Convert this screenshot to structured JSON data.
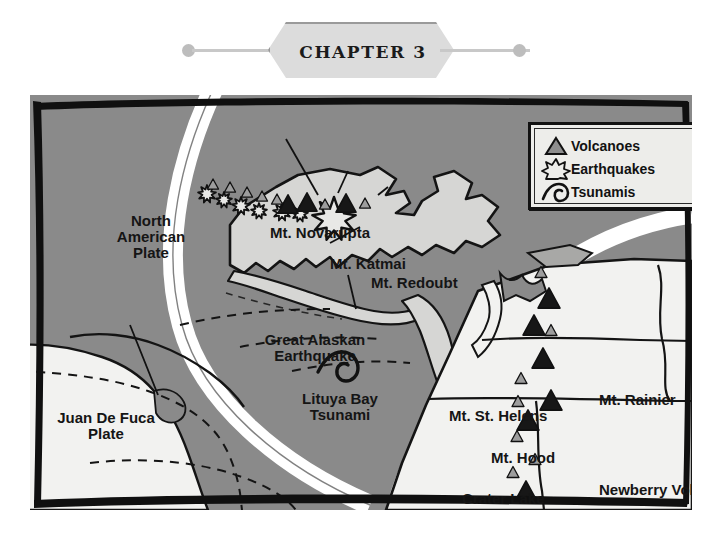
{
  "header": {
    "chapter_label": "CHAPTER 3",
    "left_dot": "header-dot",
    "right_dot": "header-dot"
  },
  "legend": {
    "title": "Map Legend",
    "items": [
      {
        "icon": "triangle-icon",
        "label": "Volcanoes"
      },
      {
        "icon": "starburst-icon",
        "label": "Earthquakes"
      },
      {
        "icon": "wave-icon",
        "label": "Tsunamis"
      }
    ]
  },
  "map": {
    "plate_labels": [
      {
        "name": "north-american-plate",
        "lines": [
          "North",
          "American",
          "Plate"
        ],
        "x": 62,
        "y": 118,
        "w": 118,
        "size": 15
      },
      {
        "name": "juan-de-fuca-plate",
        "lines": [
          "Juan De Fuca",
          "Plate"
        ],
        "x": 6,
        "y": 315,
        "w": 140,
        "size": 15
      },
      {
        "name": "pacific-plate",
        "lines": [
          "Pacific",
          "Plate"
        ],
        "x": 32,
        "y": 425,
        "w": 98,
        "size": 15
      }
    ],
    "feature_labels": [
      {
        "name": "mt-novarupta",
        "lines": [
          "Mt. Novarupta"
        ],
        "x": 240,
        "y": 130,
        "w": 160,
        "size": 15,
        "align": "l"
      },
      {
        "name": "mt-katmai",
        "lines": [
          "Mt. Katmai"
        ],
        "x": 300,
        "y": 161,
        "w": 140,
        "size": 15,
        "align": "l"
      },
      {
        "name": "mt-redoubt",
        "lines": [
          "Mt. Redoubt"
        ],
        "x": 341,
        "y": 180,
        "w": 150,
        "size": 15,
        "align": "l"
      },
      {
        "name": "great-alaskan-earthquake",
        "lines": [
          "Great Alaskan",
          "Earthquake"
        ],
        "x": 215,
        "y": 237,
        "w": 140,
        "size": 15,
        "align": "c"
      },
      {
        "name": "lituya-bay-tsunami",
        "lines": [
          "Lituya Bay",
          "Tsunami"
        ],
        "x": 256,
        "y": 296,
        "w": 108,
        "size": 15,
        "align": "c"
      },
      {
        "name": "mt-st-helens",
        "lines": [
          "Mt. St. Helens"
        ],
        "x": 419,
        "y": 313,
        "w": 140,
        "size": 15,
        "align": "l"
      },
      {
        "name": "mt-rainier",
        "lines": [
          "Mt. Rainier"
        ],
        "x": 569,
        "y": 297,
        "w": 120,
        "size": 15,
        "align": "l"
      },
      {
        "name": "mt-hood",
        "lines": [
          "Mt. Hood"
        ],
        "x": 461,
        "y": 355,
        "w": 100,
        "size": 15,
        "align": "l"
      },
      {
        "name": "newberry-volcano",
        "lines": [
          "Newberry Volcano"
        ],
        "x": 569,
        "y": 387,
        "w": 170,
        "size": 15,
        "align": "l"
      },
      {
        "name": "crater-lake",
        "lines": [
          "Crater Lake"
        ],
        "x": 432,
        "y": 396,
        "w": 122,
        "size": 15,
        "align": "l"
      },
      {
        "name": "lassen-volcano",
        "lines": [
          "Lassen Volcano"
        ],
        "x": 407,
        "y": 478,
        "w": 145,
        "size": 15,
        "align": "l"
      }
    ],
    "colors": {
      "ocean": "#8a8a8a",
      "land": "#f2f2f0",
      "alaska_land": "#d6d6d4",
      "arc_band": "#ffffff",
      "ink": "#111111",
      "legend_bg": "#ededea",
      "volcano_major": "#171717",
      "volcano_minor": "#9d9d9d"
    },
    "volcanoes_major": [
      {
        "name": "mt-rainier-marker",
        "x": 549,
        "y": 298
      },
      {
        "name": "mt-st-helens-marker",
        "x": 534,
        "y": 325
      },
      {
        "name": "mt-hood-marker",
        "x": 543,
        "y": 358
      },
      {
        "name": "newberry-marker",
        "x": 551,
        "y": 400
      },
      {
        "name": "crater-lake-marker",
        "x": 528,
        "y": 420
      },
      {
        "name": "lassen-marker",
        "x": 526,
        "y": 491
      }
    ],
    "volcanoes_minor": [
      {
        "name": "minor-volcano",
        "x": 541,
        "y": 272
      },
      {
        "name": "minor-volcano",
        "x": 551,
        "y": 330
      },
      {
        "name": "minor-volcano",
        "x": 521,
        "y": 378
      },
      {
        "name": "minor-volcano",
        "x": 518,
        "y": 401
      },
      {
        "name": "minor-volcano",
        "x": 517,
        "y": 436
      },
      {
        "name": "minor-volcano",
        "x": 535,
        "y": 459
      },
      {
        "name": "minor-volcano",
        "x": 513,
        "y": 472
      }
    ],
    "alaska_volcanoes_major": [
      {
        "name": "alaska-volcano",
        "x": 288,
        "y": 204
      },
      {
        "name": "alaska-volcano",
        "x": 307,
        "y": 202
      },
      {
        "name": "alaska-volcano",
        "x": 346,
        "y": 203
      }
    ],
    "alaska_volcanoes_minor": [
      {
        "name": "alaska-minor-volcano",
        "x": 213,
        "y": 184
      },
      {
        "name": "alaska-minor-volcano",
        "x": 230,
        "y": 187
      },
      {
        "name": "alaska-minor-volcano",
        "x": 247,
        "y": 192
      },
      {
        "name": "alaska-minor-volcano",
        "x": 262,
        "y": 196
      },
      {
        "name": "alaska-minor-volcano",
        "x": 277,
        "y": 199
      },
      {
        "name": "alaska-minor-volcano",
        "x": 325,
        "y": 204
      },
      {
        "name": "alaska-minor-volcano",
        "x": 365,
        "y": 203
      }
    ],
    "earthquakes": [
      {
        "name": "earthquake-star",
        "x": 207,
        "y": 194,
        "r": 9
      },
      {
        "name": "earthquake-star",
        "x": 224,
        "y": 200,
        "r": 8
      },
      {
        "name": "earthquake-star",
        "x": 241,
        "y": 206,
        "r": 9
      },
      {
        "name": "earthquake-star",
        "x": 259,
        "y": 211,
        "r": 8
      },
      {
        "name": "earthquake-star",
        "x": 282,
        "y": 212,
        "r": 9
      },
      {
        "name": "earthquake-star",
        "x": 300,
        "y": 214,
        "r": 8
      },
      {
        "name": "great-alaskan-earthquake-star",
        "x": 334,
        "y": 219,
        "r": 22
      }
    ],
    "tsunami_marker": {
      "name": "lituya-bay-tsunami-wave",
      "x": 322,
      "y": 264
    }
  }
}
